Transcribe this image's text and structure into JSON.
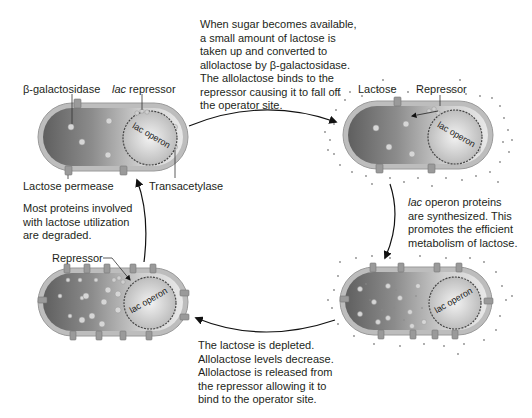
{
  "colors": {
    "text": "#231f20",
    "cell_dark": "#6e6e6e",
    "cell_light": "#d9d9d9",
    "cell_wall": "#b8b8b8",
    "protein": "#c8c8c8",
    "lactose_dot": "#8a8a8a"
  },
  "cells": {
    "top_left": {
      "labels": {
        "beta_gal": "β-galactosidase",
        "lac_repressor_italic": "lac",
        "lac_repressor_rest": " repressor",
        "permease": "Lactose permease",
        "transacetylase": "Transacetylase",
        "operon": "lac operon"
      }
    },
    "top_right": {
      "labels": {
        "lactose": "Lactose",
        "repressor": "Repressor",
        "operon": "lac operon"
      }
    },
    "bottom_right": {
      "labels": {
        "operon": "lac operon"
      }
    },
    "bottom_left": {
      "labels": {
        "repressor": "Repressor",
        "operon": "lac operon"
      }
    }
  },
  "captions": {
    "top": [
      "When sugar becomes available,",
      "a small amount of lactose is",
      "taken up and converted to",
      "allolactose by β-galactosidase.",
      "The allolactose binds to the",
      "repressor causing it to fall off",
      "the operator site."
    ],
    "right_italic": "lac",
    "right": [
      " operon proteins",
      "are synthesized. This",
      "promotes the efficient",
      "metabolism of lactose."
    ],
    "bottom": [
      "The lactose is depleted.",
      "Allolactose levels decrease.",
      "Allolactose is released from",
      "the repressor allowing it to",
      "bind to the operator site."
    ],
    "left": [
      "Most proteins involved",
      "with lactose utilization",
      "are degraded."
    ]
  }
}
